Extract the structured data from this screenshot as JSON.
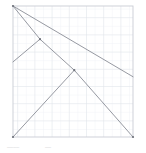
{
  "figure": {
    "type": "line-diagram",
    "title": "",
    "background_color": "#ffffff",
    "plot_area": {
      "x": 13,
      "y": 6,
      "width": 120,
      "height": 131,
      "border_color": "#c9ccd4",
      "fill_color": "#ffffff"
    },
    "grid": {
      "visible": true,
      "minor_color": "#eceef2",
      "major_color": "#dfe2e8",
      "minor_spacing": 8.6,
      "major_spacing": 17.2,
      "x_divisions": 14,
      "y_divisions": 15
    },
    "axes": {
      "x_range": [
        0,
        14
      ],
      "y_range": [
        0,
        15
      ],
      "x_ticks": [],
      "y_ticks": [],
      "xlabel": "",
      "ylabel": ""
    },
    "line_style": {
      "color": "#8a8d96",
      "width": 0.9
    },
    "vertex_style": {
      "color": "#6f727b",
      "radius": 1.1
    }
  },
  "chart_data": {
    "type": "line",
    "title": "",
    "xlabel": "",
    "ylabel": "",
    "xlim": [
      0,
      14
    ],
    "ylim": [
      0,
      15
    ],
    "grid": true,
    "legend": "none",
    "series": [
      {
        "name": "segment-1",
        "comment": "top-left corner down-right to right edge",
        "points": [
          [
            0,
            15
          ],
          [
            14,
            6.9
          ]
        ]
      },
      {
        "name": "segment-2",
        "comment": "top-left corner through vertex-a and vertex-b to bottom-right corner",
        "points": [
          [
            0,
            15
          ],
          [
            3.15,
            11.2
          ],
          [
            7.15,
            7.65
          ],
          [
            14,
            0
          ]
        ]
      },
      {
        "name": "segment-3",
        "comment": "vertex-a down-left to left edge",
        "points": [
          [
            3.15,
            11.2
          ],
          [
            0,
            8.6
          ]
        ]
      },
      {
        "name": "segment-4",
        "comment": "vertex-b down-left to bottom-left corner",
        "points": [
          [
            7.15,
            7.65
          ],
          [
            0,
            0
          ]
        ]
      }
    ],
    "vertices": [
      {
        "name": "origin-top-left",
        "x": 0,
        "y": 15
      },
      {
        "name": "vertex-a",
        "x": 3.15,
        "y": 11.2
      },
      {
        "name": "vertex-b",
        "x": 7.15,
        "y": 7.65
      },
      {
        "name": "corner-bottom-left",
        "x": 0,
        "y": 0
      },
      {
        "name": "corner-bottom-right",
        "x": 14,
        "y": 0
      },
      {
        "name": "right-edge-point",
        "x": 14,
        "y": 6.9
      }
    ]
  },
  "caption": {
    "left_text": "————",
    "right_text": "——"
  }
}
